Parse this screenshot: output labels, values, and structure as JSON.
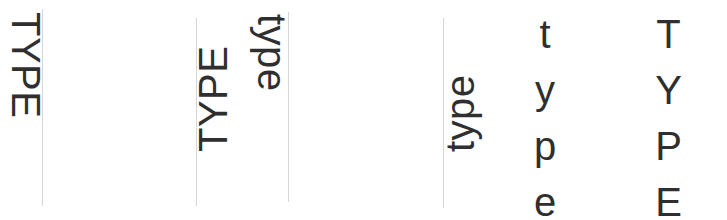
{
  "specimen": {
    "text_color": "#2f2f2f",
    "guide_color": "#d6d6d6",
    "background": "#ffffff",
    "samples": [
      {
        "id": "sample-1",
        "word": "TYPE",
        "case": "uppercase",
        "orientation": "rotated-clockwise",
        "has_guide": true
      },
      {
        "id": "sample-2",
        "word": "TYPE",
        "case": "uppercase",
        "orientation": "rotated-counterclockwise",
        "has_guide": true
      },
      {
        "id": "sample-3",
        "word": "type",
        "case": "lowercase",
        "orientation": "rotated-clockwise",
        "has_guide": true
      },
      {
        "id": "sample-4",
        "word": "type",
        "case": "lowercase",
        "orientation": "rotated-counterclockwise",
        "has_guide": true
      },
      {
        "id": "sample-5",
        "word": "type",
        "case": "lowercase",
        "orientation": "upright-stacked",
        "has_guide": false,
        "letters": [
          "t",
          "y",
          "p",
          "e"
        ]
      },
      {
        "id": "sample-6",
        "word": "TYPE",
        "case": "uppercase",
        "orientation": "upright-stacked",
        "has_guide": false,
        "letters": [
          "T",
          "Y",
          "P",
          "E"
        ]
      }
    ]
  }
}
